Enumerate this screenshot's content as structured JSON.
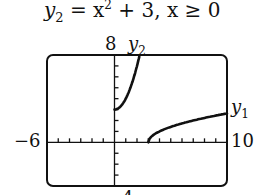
{
  "equation": {
    "lhs": "y",
    "lhs_sub": "2",
    "rhs": " = x",
    "rhs_sup": "2",
    "rest": " + 3, x ≥ 0"
  },
  "labels": {
    "ymax": "8",
    "y2_name": "y",
    "y2_sub": "2",
    "y1_name": "y",
    "y1_sub": "1",
    "xmin": "−6",
    "xmax": "10",
    "ymin": "−4"
  },
  "chart_data": {
    "type": "line",
    "xlabel": "",
    "ylabel": "",
    "xlim": [
      -6,
      10
    ],
    "ylim": [
      -4,
      8
    ],
    "grid": false,
    "tick_spacing": 1,
    "series": [
      {
        "name": "y2",
        "function": "x^2 + 3, x >= 0",
        "x": [
          0,
          0.5,
          1,
          1.5,
          2,
          2.24
        ],
        "y": [
          3,
          3.25,
          4,
          5.25,
          7,
          8
        ]
      },
      {
        "name": "y1",
        "function": "sqrt(x - 3)",
        "x": [
          3,
          4,
          5,
          6,
          7,
          8,
          9,
          10
        ],
        "y": [
          0,
          1,
          1.41,
          1.73,
          2,
          2.24,
          2.45,
          2.65
        ]
      }
    ]
  }
}
